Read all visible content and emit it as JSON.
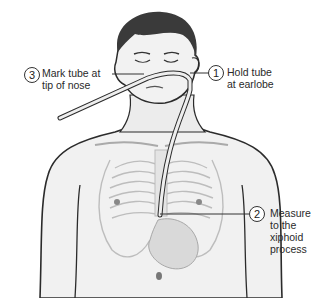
{
  "diagram": {
    "steps": [
      {
        "number": "1",
        "text_line1": "Hold tube",
        "text_line2": "at earlobe"
      },
      {
        "number": "2",
        "text_line1": "Measure",
        "text_line2": "to the",
        "text_line3": "xiphoid",
        "text_line4": "process"
      },
      {
        "number": "3",
        "text_line1": "Mark tube at",
        "text_line2": "tip of nose"
      }
    ],
    "colors": {
      "skin": "#f0f0f0",
      "outline": "#2b2b2b",
      "ribs": "#bdbdbd",
      "hair": "#3a3a3a",
      "tube": "#e8e8e8"
    }
  }
}
